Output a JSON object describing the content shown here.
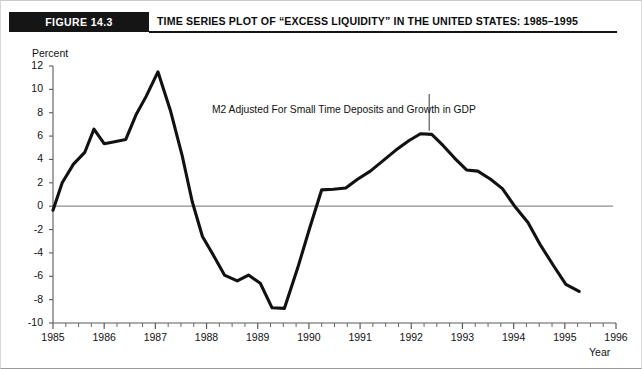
{
  "header": {
    "figure_badge": "FIGURE 14.3",
    "title": "TIME SERIES PLOT OF “EXCESS LIQUIDITY” IN THE UNITED STATES: 1985–1995"
  },
  "colors": {
    "line": "#111111",
    "zero_line": "#8d8d8d",
    "axis": "#5a5a5a",
    "badge_bg": "#151515",
    "badge_text": "#ffffff",
    "text": "#111111",
    "frame": "#cfcfcf"
  },
  "chart_data": {
    "type": "line",
    "title": "TIME SERIES PLOT OF “EXCESS LIQUIDITY” IN THE UNITED STATES: 1985–1995",
    "xlabel": "Year",
    "ylabel": "Percent",
    "xlim": [
      1985,
      1996
    ],
    "ylim": [
      -10,
      12
    ],
    "grid": false,
    "legend": null,
    "x_ticks": [
      1985,
      1986,
      1987,
      1988,
      1989,
      1990,
      1991,
      1992,
      1993,
      1994,
      1995,
      1996
    ],
    "x_tick_labels": [
      "1985",
      "1986",
      "1987",
      "1988",
      "1989",
      "1990",
      "1991",
      "1992",
      "1993",
      "1994",
      "1995",
      "1996"
    ],
    "x_minor_ticks_per_interval": 4,
    "y_ticks": [
      -10,
      -8,
      -6,
      -4,
      -2,
      0,
      2,
      4,
      6,
      8,
      10,
      12
    ],
    "y_tick_labels": [
      "-10",
      "-8",
      "-6",
      "-4",
      "-2",
      "0",
      "2",
      "4",
      "6",
      "8",
      "10",
      "12"
    ],
    "zero_line": 0,
    "annotations": [
      {
        "text": "M2 Adjusted For Small Time Deposits and Growth in GDP",
        "x": 1992.35,
        "y": 6.2,
        "leader": {
          "from_x": 1992.35,
          "from_y": 9.6,
          "to_x": 1992.35,
          "to_y": 6.45
        }
      }
    ],
    "series": [
      {
        "name": "Excess liquidity",
        "x": [
          1985.0,
          1985.18,
          1985.4,
          1985.62,
          1985.8,
          1986.0,
          1986.18,
          1986.42,
          1986.62,
          1986.82,
          1987.05,
          1987.3,
          1987.52,
          1987.72,
          1987.92,
          1988.12,
          1988.35,
          1988.6,
          1988.82,
          1989.05,
          1989.28,
          1989.52,
          1989.78,
          1990.02,
          1990.25,
          1990.48,
          1990.72,
          1990.95,
          1991.2,
          1991.45,
          1991.7,
          1991.95,
          1992.18,
          1992.4,
          1992.62,
          1992.85,
          1993.08,
          1993.3,
          1993.55,
          1993.78,
          1994.02,
          1994.28,
          1994.52,
          1994.78,
          1995.02,
          1995.28
        ],
        "y": [
          -0.35,
          2.0,
          3.6,
          4.6,
          6.6,
          5.35,
          5.5,
          5.7,
          7.8,
          9.4,
          11.5,
          8.1,
          4.4,
          0.4,
          -2.6,
          -4.1,
          -5.9,
          -6.4,
          -5.9,
          -6.6,
          -8.7,
          -8.75,
          -5.3,
          -1.8,
          1.4,
          1.45,
          1.55,
          2.3,
          3.0,
          3.9,
          4.8,
          5.6,
          6.2,
          6.15,
          5.2,
          4.1,
          3.1,
          3.0,
          2.3,
          1.5,
          0.0,
          -1.4,
          -3.3,
          -5.1,
          -6.7,
          -7.3
        ]
      }
    ]
  }
}
